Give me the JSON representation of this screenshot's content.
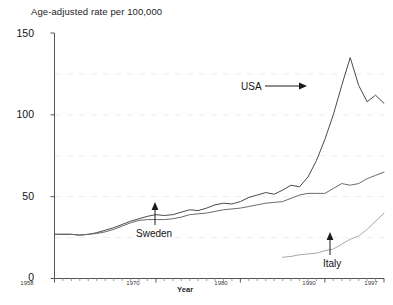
{
  "chart_data": {
    "type": "line",
    "title": "",
    "ylabel": "Age-adjusted rate per 100,000",
    "xlabel": "Year",
    "ylim": [
      0,
      150
    ],
    "xlim": [
      1958,
      1997
    ],
    "yticks": [
      0,
      50,
      100,
      150
    ],
    "ytick_labels": [
      "0",
      "50",
      "100",
      "150"
    ],
    "xticks": [
      1958,
      1970,
      1980,
      1990,
      1997
    ],
    "xtick_labels": [
      "1958",
      "1970",
      "1980",
      "1990",
      "1997"
    ],
    "grid": "horizontal-faint-dashed-at-25-75-125",
    "legend": "inline-annotations-with-arrows",
    "series": [
      {
        "name": "USA",
        "color": "#4a4a4a",
        "annotation": "USA",
        "arrow": "right",
        "x": [
          1958,
          1959,
          1960,
          1961,
          1962,
          1963,
          1964,
          1965,
          1966,
          1967,
          1968,
          1969,
          1970,
          1971,
          1972,
          1973,
          1974,
          1975,
          1976,
          1977,
          1978,
          1979,
          1980,
          1981,
          1982,
          1983,
          1984,
          1985,
          1986,
          1987,
          1988,
          1989,
          1990,
          1991,
          1992,
          1993,
          1994,
          1995,
          1996,
          1997
        ],
        "values": [
          27,
          27,
          27,
          26.5,
          27,
          28,
          29.5,
          31,
          33,
          35,
          36.5,
          38,
          39,
          38.5,
          39,
          40.5,
          42,
          41.5,
          43,
          45,
          46,
          45.5,
          47,
          49.5,
          51,
          52.5,
          51.5,
          54,
          57,
          56,
          62,
          72,
          85,
          100,
          118,
          135,
          118,
          108,
          112,
          107
        ]
      },
      {
        "name": "Sweden",
        "color": "#6a6a6a",
        "annotation": "Sweden",
        "arrow": "up",
        "x": [
          1958,
          1959,
          1960,
          1961,
          1962,
          1963,
          1964,
          1965,
          1966,
          1967,
          1968,
          1969,
          1970,
          1971,
          1972,
          1973,
          1974,
          1975,
          1976,
          1977,
          1978,
          1979,
          1980,
          1981,
          1982,
          1983,
          1984,
          1985,
          1986,
          1987,
          1988,
          1989,
          1990,
          1991,
          1992,
          1993,
          1994,
          1995,
          1996,
          1997
        ],
        "values": [
          27,
          27,
          27,
          26.5,
          27,
          27.5,
          28.5,
          30,
          32,
          34,
          35.5,
          36,
          36,
          36,
          36.5,
          37.5,
          39,
          39.5,
          40,
          41,
          42,
          42.5,
          43,
          44,
          45,
          46,
          46.5,
          47,
          49,
          51,
          52,
          52,
          52,
          55,
          58,
          57,
          58,
          61,
          63,
          65
        ]
      },
      {
        "name": "Italy",
        "color": "#a8a8a8",
        "annotation": "Italy",
        "arrow": "up",
        "x": [
          1985,
          1986,
          1987,
          1988,
          1989,
          1990,
          1991,
          1992,
          1993,
          1994,
          1995,
          1996,
          1997
        ],
        "values": [
          13,
          13.5,
          14.5,
          15,
          15.5,
          17,
          18,
          21,
          24,
          26,
          30,
          35,
          40
        ]
      }
    ]
  }
}
